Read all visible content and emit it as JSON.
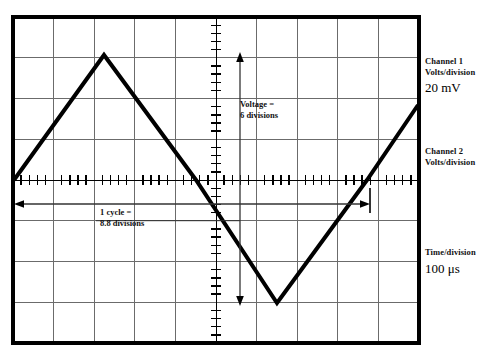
{
  "figure": {
    "name": "oscilloscope-display",
    "graticule": {
      "columns": 10,
      "rows": 8,
      "left": 13,
      "top": 17,
      "right": 419,
      "bottom": 343,
      "border_color": "#000000",
      "grid_color": "#6b6b6b",
      "center_axis_ticks_per_division": 5
    },
    "waveform": {
      "type": "triangle",
      "trace_color": "#000000",
      "vertices": [
        {
          "x": 14,
          "y": 180
        },
        {
          "x": 104,
          "y": 55
        },
        {
          "x": 196,
          "y": 180
        },
        {
          "x": 277,
          "y": 303
        },
        {
          "x": 367,
          "y": 180
        },
        {
          "x": 418,
          "y": 105
        }
      ]
    }
  },
  "measurements": {
    "voltage": {
      "line1": "Voltage =",
      "line2": "6 divisions",
      "arrow_top_y": 55,
      "arrow_bottom_y": 303,
      "arrow_x": 240,
      "divisions": 6
    },
    "cycle": {
      "line1": "1 cycle =",
      "line2": "8.8 divisions",
      "arrow_left_x": 16,
      "arrow_right_x": 368,
      "arrow_y": 204,
      "divisions": 8.8
    }
  },
  "controls": {
    "channel1": {
      "line1": "Channel 1",
      "line2": "Volts/division",
      "value": "20 mV"
    },
    "channel2": {
      "line1": "Channel 2",
      "line2": "Volts/division",
      "value": ""
    },
    "time": {
      "line1": "Time/division",
      "value": "100 μs"
    }
  }
}
